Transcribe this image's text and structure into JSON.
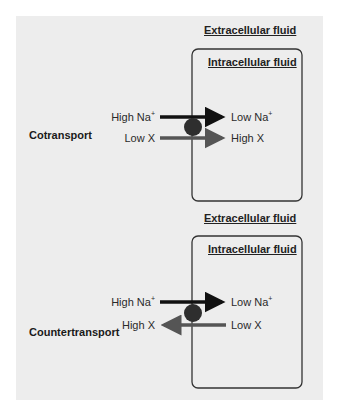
{
  "colors": {
    "background": "#ededed",
    "sodium_arrow": "#111111",
    "solute_arrow": "#555555",
    "carrier": "#2e2e2e",
    "membrane": "#333333"
  },
  "panels": [
    {
      "title": "Cotransport",
      "outside_label": "Extracellular fluid",
      "inside_label": "Intracellular fluid",
      "sodium": {
        "outside": "High Na",
        "inside": "Low Na",
        "charge": "+",
        "direction": "inward"
      },
      "solute": {
        "outside": "Low X",
        "inside": "High X",
        "direction": "inward"
      }
    },
    {
      "title": "Countertransport",
      "outside_label": "Extracellular fluid",
      "inside_label": "Intracellular fluid",
      "sodium": {
        "outside": "High Na",
        "inside": "Low Na",
        "charge": "+",
        "direction": "inward"
      },
      "solute": {
        "outside": "High X",
        "inside": "Low X",
        "direction": "outward"
      }
    }
  ]
}
